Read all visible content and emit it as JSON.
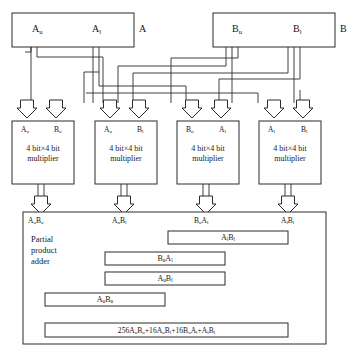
{
  "diagram": {
    "type": "block-diagram",
    "stroke_color": "#2b2b2b",
    "fill_color": "#ffffff",
    "registers": [
      {
        "id": "A",
        "outside_label": "A",
        "halves": [
          {
            "name": "A-upper",
            "base": "A",
            "sub": "u"
          },
          {
            "name": "A-lower",
            "base": "A",
            "sub": "l"
          }
        ]
      },
      {
        "id": "B",
        "outside_label": "B",
        "halves": [
          {
            "name": "B-upper",
            "base": "B",
            "sub": "u"
          },
          {
            "name": "B-lower",
            "base": "B",
            "sub": "l"
          }
        ]
      }
    ],
    "multipliers": [
      {
        "id": "m1",
        "text": "4 bit×4 bit multiplier",
        "line1": "4 bit×4 bit",
        "line2": "multiplier",
        "inputs": [
          {
            "base": "A",
            "sub": "u"
          },
          {
            "base": "B",
            "sub": "u"
          }
        ],
        "output": {
          "base1": "A",
          "sub1": "u",
          "base2": "B",
          "sub2": "u"
        }
      },
      {
        "id": "m2",
        "text": "4 bit×4 bit multiplier",
        "line1": "4 bit×4 bit",
        "line2": "multiplier",
        "inputs": [
          {
            "base": "A",
            "sub": "u"
          },
          {
            "base": "B",
            "sub": "l"
          }
        ],
        "output": {
          "base1": "A",
          "sub1": "u",
          "base2": "B",
          "sub2": "l"
        }
      },
      {
        "id": "m3",
        "text": "4 bit×4 bit multiplier",
        "line1": "4 bit×4 bit",
        "line2": "multiplier",
        "inputs": [
          {
            "base": "B",
            "sub": "u"
          },
          {
            "base": "A",
            "sub": "l"
          }
        ],
        "output": {
          "base1": "B",
          "sub1": "u",
          "base2": "A",
          "sub2": "l"
        }
      },
      {
        "id": "m4",
        "text": "4 bit×4 bit multiplier",
        "line1": "4 bit×4 bit",
        "line2": "multiplier",
        "inputs": [
          {
            "base": "A",
            "sub": "l"
          },
          {
            "base": "B",
            "sub": "l"
          }
        ],
        "output": {
          "base1": "A",
          "sub1": "l",
          "base2": "B",
          "sub2": "l"
        }
      }
    ],
    "adder": {
      "name_line1": "Partial",
      "name_line2": "product",
      "name_line3": "adder",
      "input_labels": [
        {
          "base1": "A",
          "sub1": "u",
          "base2": "B",
          "sub2": "u"
        },
        {
          "base1": "A",
          "sub1": "u",
          "base2": "B",
          "sub2": "l"
        },
        {
          "base1": "B",
          "sub1": "u",
          "base2": "A",
          "sub2": "l"
        },
        {
          "base1": "A",
          "sub1": "l",
          "base2": "B",
          "sub2": "l"
        }
      ],
      "bars": [
        {
          "id": "bar-AlBl",
          "base1": "A",
          "sub1": "l",
          "base2": "B",
          "sub2": "l"
        },
        {
          "id": "bar-BuAl",
          "base1": "B",
          "sub1": "u",
          "base2": "A",
          "sub2": "l"
        },
        {
          "id": "bar-AuBl",
          "base1": "A",
          "sub1": "u",
          "base2": "B",
          "sub2": "l"
        },
        {
          "id": "bar-AuBu",
          "base1": "A",
          "sub1": "u",
          "base2": "B",
          "sub2": "u"
        }
      ],
      "result_bar": {
        "id": "bar-result",
        "equation_plain": "256AuBu + 16AuBl + 16BuAl + AlBl",
        "terms": [
          {
            "coef": "256",
            "base1": "A",
            "sub1": "u",
            "base2": "B",
            "sub2": "u"
          },
          {
            "coef": "16",
            "base1": "A",
            "sub1": "u",
            "base2": "B",
            "sub2": "l"
          },
          {
            "coef": "16",
            "base1": "B",
            "sub1": "u",
            "base2": "A",
            "sub2": "l"
          },
          {
            "coef": "",
            "base1": "A",
            "sub1": "l",
            "base2": "B",
            "sub2": "l"
          }
        ],
        "operator": "+"
      }
    }
  }
}
